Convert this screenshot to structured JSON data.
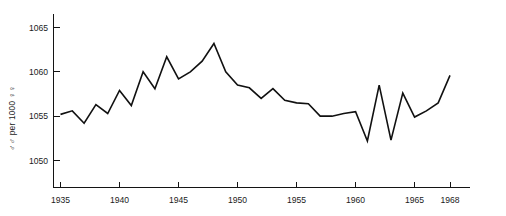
{
  "chart_data": {
    "type": "line",
    "title": "",
    "subtitle": "",
    "xlabel": "",
    "ylabel": "♂♂ per 1000 ♀♀",
    "xlim": [
      1935,
      1968
    ],
    "ylim": [
      1047.5,
      1066.5
    ],
    "grid": false,
    "legend": null,
    "xticks": [
      1935,
      1940,
      1945,
      1950,
      1955,
      1960,
      1965,
      1968
    ],
    "xtick_labels": [
      "1935",
      "1940",
      "1945",
      "1950",
      "1955",
      "1960",
      "1965",
      "1968"
    ],
    "yticks": [
      1050,
      1055,
      1060,
      1065
    ],
    "ytick_labels": [
      "1050",
      "1055",
      "1060",
      "1065"
    ],
    "series": [
      {
        "name": "sex ratio at birth",
        "color": "#111111",
        "x": [
          1935,
          1936,
          1937,
          1938,
          1939,
          1940,
          1941,
          1942,
          1943,
          1944,
          1945,
          1946,
          1947,
          1948,
          1949,
          1950,
          1951,
          1952,
          1953,
          1954,
          1955,
          1956,
          1957,
          1958,
          1959,
          1960,
          1961,
          1962,
          1963,
          1964,
          1965,
          1966,
          1967,
          1968
        ],
        "values": [
          1055.2,
          1055.6,
          1054.2,
          1056.3,
          1055.3,
          1057.9,
          1056.2,
          1060.0,
          1058.1,
          1061.7,
          1059.2,
          1060.0,
          1061.2,
          1063.2,
          1060.0,
          1058.5,
          1058.2,
          1057.0,
          1058.1,
          1056.8,
          1056.5,
          1056.4,
          1055.0,
          1055.0,
          1055.3,
          1055.5,
          1052.2,
          1058.5,
          1052.3,
          1057.6,
          1054.9,
          1055.6,
          1056.5,
          1059.6
        ]
      }
    ]
  },
  "axes": {
    "y_axis_name": "y-axis",
    "x_axis_name": "x-axis"
  }
}
